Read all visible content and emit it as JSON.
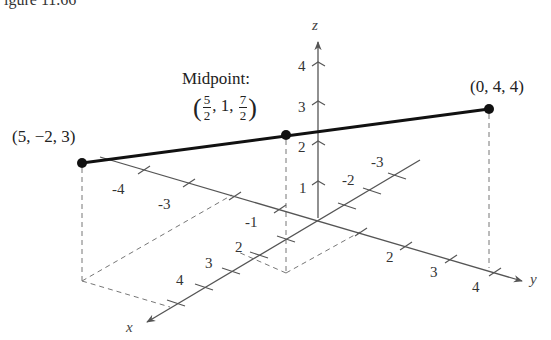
{
  "caption_fragment": "igure 11.66",
  "axes": {
    "x_label": "x",
    "y_label": "y",
    "z_label": "z",
    "x_ticks": [
      "-4",
      "-3",
      "-1",
      "2",
      "3",
      "4"
    ],
    "y_ticks": [
      "-3",
      "-2",
      "2",
      "3",
      "4"
    ],
    "z_ticks": [
      "1",
      "2",
      "3",
      "4"
    ]
  },
  "points": {
    "p1": {
      "label": "(5, −2, 3)"
    },
    "p2": {
      "label": "(0, 4, 4)"
    },
    "midpoint": {
      "title": "Midpoint:",
      "open": "(",
      "x_num": "5",
      "x_den": "2",
      "sep1": ", 1, ",
      "z_num": "7",
      "z_den": "2",
      "close": ")"
    }
  },
  "colors": {
    "axis": "#555555",
    "segment": "#111111",
    "dashed": "#777777"
  }
}
